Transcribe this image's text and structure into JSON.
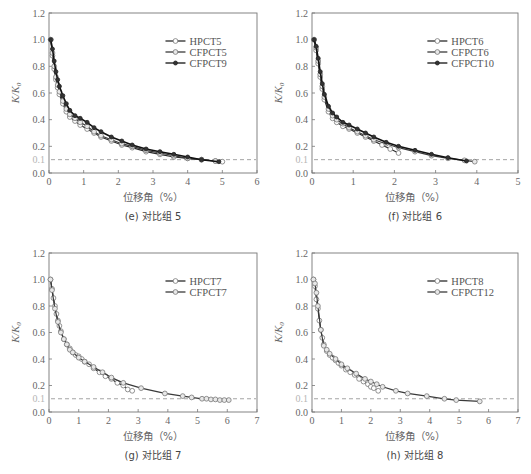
{
  "chart_data": [
    {
      "type": "line",
      "panel": "e",
      "caption": "(e) 对比组 5",
      "xlabel": "位移角（%）",
      "ylabel": "K/K0",
      "xlim": [
        0,
        6
      ],
      "ylim": [
        0,
        1.2
      ],
      "xticks": [
        0,
        1,
        2,
        3,
        4,
        5,
        6
      ],
      "yticks": [
        0.0,
        0.2,
        0.4,
        0.6,
        0.8,
        1.0,
        1.2
      ],
      "reference_line": {
        "y": 0.1,
        "style": "dashed",
        "label": "0.1"
      },
      "legend_position": "top-right",
      "series": [
        {
          "name": "HPCT5",
          "marker": "open-circle",
          "x": [
            0.05,
            0.1,
            0.15,
            0.2,
            0.25,
            0.3,
            0.4,
            0.5,
            0.6,
            0.75,
            0.9,
            1.1,
            1.3,
            1.5,
            1.8,
            2.1,
            2.4,
            2.8,
            3.2,
            3.6,
            4.0,
            4.4,
            4.8,
            5.0
          ],
          "y": [
            1.0,
            0.88,
            0.78,
            0.7,
            0.64,
            0.59,
            0.52,
            0.46,
            0.42,
            0.39,
            0.36,
            0.33,
            0.3,
            0.27,
            0.24,
            0.21,
            0.19,
            0.16,
            0.14,
            0.12,
            0.11,
            0.1,
            0.09,
            0.085
          ]
        },
        {
          "name": "CFPCT5",
          "marker": "circle-dot",
          "x": [
            0.05,
            0.1,
            0.15,
            0.2,
            0.25,
            0.3,
            0.4,
            0.5,
            0.6,
            0.75,
            0.9,
            1.1,
            1.3,
            1.5,
            1.8,
            2.1,
            2.4,
            2.8,
            3.2,
            3.6,
            4.0,
            4.4,
            4.8
          ],
          "y": [
            1.0,
            0.9,
            0.8,
            0.72,
            0.66,
            0.61,
            0.54,
            0.48,
            0.44,
            0.41,
            0.38,
            0.35,
            0.31,
            0.28,
            0.25,
            0.22,
            0.2,
            0.17,
            0.15,
            0.13,
            0.11,
            0.1,
            0.09
          ]
        },
        {
          "name": "CFPCT9",
          "marker": "filled-circle",
          "x": [
            0.05,
            0.1,
            0.15,
            0.2,
            0.25,
            0.3,
            0.4,
            0.5,
            0.6,
            0.75,
            0.9,
            1.1,
            1.3,
            1.5,
            1.8,
            2.1,
            2.4,
            2.8,
            3.2,
            3.6,
            4.0,
            4.4,
            4.9
          ],
          "y": [
            1.0,
            0.93,
            0.84,
            0.76,
            0.7,
            0.65,
            0.58,
            0.52,
            0.47,
            0.43,
            0.41,
            0.38,
            0.34,
            0.31,
            0.27,
            0.24,
            0.21,
            0.18,
            0.16,
            0.14,
            0.12,
            0.1,
            0.085
          ]
        }
      ]
    },
    {
      "type": "line",
      "panel": "f",
      "caption": "(f) 对比组 6",
      "xlabel": "位移角（%）",
      "ylabel": "K/K0",
      "xlim": [
        0,
        5
      ],
      "ylim": [
        0,
        1.2
      ],
      "xticks": [
        0,
        1,
        2,
        3,
        4,
        5
      ],
      "yticks": [
        0.0,
        0.2,
        0.4,
        0.6,
        0.8,
        1.0,
        1.2
      ],
      "reference_line": {
        "y": 0.1,
        "style": "dashed",
        "label": "0.1"
      },
      "legend_position": "top-right",
      "series": [
        {
          "name": "HPCT6",
          "marker": "open-circle",
          "x": [
            0.05,
            0.1,
            0.15,
            0.2,
            0.25,
            0.3,
            0.4,
            0.5,
            0.6,
            0.75,
            0.9,
            1.1,
            1.3,
            1.5,
            1.7,
            1.9,
            2.1
          ],
          "y": [
            1.0,
            0.92,
            0.82,
            0.72,
            0.63,
            0.55,
            0.46,
            0.41,
            0.38,
            0.35,
            0.33,
            0.3,
            0.27,
            0.24,
            0.21,
            0.18,
            0.15
          ]
        },
        {
          "name": "CFPCT6",
          "marker": "circle-dot",
          "x": [
            0.05,
            0.1,
            0.15,
            0.2,
            0.25,
            0.3,
            0.4,
            0.5,
            0.6,
            0.75,
            0.9,
            1.1,
            1.3,
            1.5,
            1.8,
            2.1,
            2.5,
            2.9,
            3.3,
            3.7,
            3.95
          ],
          "y": [
            1.0,
            0.94,
            0.84,
            0.74,
            0.65,
            0.57,
            0.48,
            0.43,
            0.4,
            0.37,
            0.34,
            0.31,
            0.28,
            0.25,
            0.22,
            0.19,
            0.16,
            0.13,
            0.11,
            0.095,
            0.085
          ]
        },
        {
          "name": "CFPCT10",
          "marker": "filled-circle",
          "x": [
            0.05,
            0.1,
            0.15,
            0.2,
            0.25,
            0.3,
            0.4,
            0.5,
            0.6,
            0.75,
            0.9,
            1.1,
            1.3,
            1.5,
            1.8,
            2.1,
            2.5,
            2.9,
            3.3,
            3.75
          ],
          "y": [
            1.0,
            0.95,
            0.86,
            0.76,
            0.67,
            0.59,
            0.5,
            0.45,
            0.42,
            0.38,
            0.36,
            0.33,
            0.3,
            0.27,
            0.23,
            0.2,
            0.17,
            0.14,
            0.115,
            0.09
          ]
        }
      ]
    },
    {
      "type": "line",
      "panel": "g",
      "caption": "(g) 对比组 7",
      "xlabel": "位移角（%）",
      "ylabel": "K/K0",
      "xlim": [
        0,
        7
      ],
      "ylim": [
        0,
        1.2
      ],
      "xticks": [
        0,
        1,
        2,
        3,
        4,
        5,
        6,
        7
      ],
      "yticks": [
        0.0,
        0.2,
        0.4,
        0.6,
        0.8,
        1.0,
        1.2
      ],
      "reference_line": {
        "y": 0.1,
        "style": "dashed",
        "label": "0.1"
      },
      "legend_position": "top-right",
      "series": [
        {
          "name": "HPCT7",
          "marker": "open-circle",
          "x": [
            0.05,
            0.1,
            0.15,
            0.2,
            0.25,
            0.3,
            0.35,
            0.4,
            0.5,
            0.6,
            0.7,
            0.8,
            0.9,
            1.0,
            1.1,
            1.2,
            1.35,
            1.5,
            1.7,
            1.9,
            2.1,
            2.3,
            2.5,
            2.65,
            2.8
          ],
          "y": [
            1.0,
            0.93,
            0.86,
            0.8,
            0.74,
            0.69,
            0.65,
            0.61,
            0.55,
            0.51,
            0.48,
            0.45,
            0.43,
            0.42,
            0.4,
            0.38,
            0.36,
            0.33,
            0.3,
            0.27,
            0.25,
            0.22,
            0.2,
            0.17,
            0.16
          ]
        },
        {
          "name": "CFPCT7",
          "marker": "circle-dot",
          "x": [
            0.05,
            0.1,
            0.2,
            0.3,
            0.4,
            0.5,
            0.6,
            0.7,
            0.8,
            1.0,
            1.2,
            1.5,
            1.8,
            2.1,
            2.5,
            3.1,
            3.9,
            4.5,
            4.8,
            5.15,
            5.3,
            5.45,
            5.6,
            5.75,
            5.9,
            6.05
          ],
          "y": [
            1.0,
            0.92,
            0.78,
            0.68,
            0.6,
            0.55,
            0.51,
            0.47,
            0.45,
            0.41,
            0.38,
            0.34,
            0.3,
            0.26,
            0.22,
            0.18,
            0.14,
            0.12,
            0.11,
            0.1,
            0.1,
            0.095,
            0.095,
            0.09,
            0.09,
            0.09
          ]
        }
      ]
    },
    {
      "type": "line",
      "panel": "h",
      "caption": "(h) 对比组 8",
      "xlabel": "位移角（%）",
      "ylabel": "K/K0",
      "xlim": [
        0,
        7
      ],
      "ylim": [
        0,
        1.2
      ],
      "xticks": [
        0,
        1,
        2,
        3,
        4,
        5,
        6,
        7
      ],
      "yticks": [
        0.0,
        0.2,
        0.4,
        0.6,
        0.8,
        1.0,
        1.2
      ],
      "reference_line": {
        "y": 0.1,
        "style": "dashed",
        "label": "0.1"
      },
      "legend_position": "top-right",
      "series": [
        {
          "name": "HPCT8",
          "marker": "open-circle",
          "x": [
            0.05,
            0.1,
            0.15,
            0.2,
            0.25,
            0.3,
            0.35,
            0.4,
            0.5,
            0.6,
            0.7,
            0.8,
            0.9,
            1.0,
            1.15,
            1.3,
            1.45,
            1.6,
            1.75,
            1.9,
            2.0,
            2.1,
            2.25
          ],
          "y": [
            1.0,
            0.95,
            0.85,
            0.78,
            0.69,
            0.62,
            0.56,
            0.51,
            0.46,
            0.43,
            0.41,
            0.39,
            0.37,
            0.35,
            0.32,
            0.3,
            0.28,
            0.25,
            0.23,
            0.21,
            0.19,
            0.18,
            0.16
          ]
        },
        {
          "name": "CFPCT12",
          "marker": "circle-dot",
          "x": [
            0.05,
            0.1,
            0.15,
            0.2,
            0.3,
            0.4,
            0.5,
            0.6,
            0.8,
            1.0,
            1.2,
            1.5,
            1.8,
            2.0,
            2.2,
            2.4,
            2.85,
            3.25,
            3.9,
            4.5,
            4.9,
            5.7
          ],
          "y": [
            1.0,
            0.97,
            0.9,
            0.8,
            0.62,
            0.5,
            0.47,
            0.44,
            0.4,
            0.36,
            0.33,
            0.29,
            0.25,
            0.23,
            0.21,
            0.19,
            0.16,
            0.14,
            0.12,
            0.1,
            0.09,
            0.08
          ]
        }
      ]
    }
  ]
}
